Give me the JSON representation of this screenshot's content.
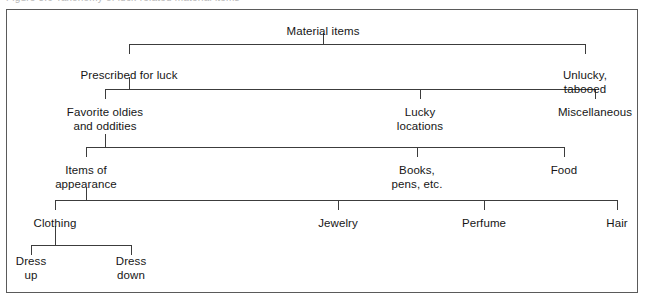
{
  "figure": {
    "caption_cut_off": "Figure 8.6   Taxonomy of luck-related material items",
    "frame_color": "#5a5a5a",
    "line_color": "#3c3c3c",
    "text_color": "#161616",
    "background": "#ffffff"
  },
  "chart_data": {
    "type": "tree",
    "title": "Material items",
    "orientation": "top-down",
    "levels": 6,
    "nodes": [
      {
        "id": "material-items",
        "label": "Material items",
        "level": 1,
        "x": 323,
        "y": 25,
        "parent": null
      },
      {
        "id": "prescribed-for-luck",
        "label": "Prescribed for luck",
        "level": 2,
        "x": 129,
        "y": 69,
        "parent": "material-items"
      },
      {
        "id": "unlucky-tabooed",
        "label": "Unlucky, tabooed",
        "level": 2,
        "x": 585,
        "y": 69,
        "parent": "material-items"
      },
      {
        "id": "favorite-oldies",
        "label": "Favorite oldies\nand oddities",
        "level": 3,
        "x": 105,
        "y": 106,
        "parent": "prescribed-for-luck"
      },
      {
        "id": "lucky-locations",
        "label": "Lucky\nlocations",
        "level": 3,
        "x": 420,
        "y": 106,
        "parent": "prescribed-for-luck"
      },
      {
        "id": "miscellaneous",
        "label": "Miscellaneous",
        "level": 3,
        "x": 595,
        "y": 106,
        "parent": "prescribed-for-luck"
      },
      {
        "id": "items-of-appearance",
        "label": "Items of\nappearance",
        "level": 4,
        "x": 86,
        "y": 164,
        "parent": "favorite-oldies"
      },
      {
        "id": "books-pens-etc",
        "label": "Books,\npens, etc.",
        "level": 4,
        "x": 417,
        "y": 164,
        "parent": "favorite-oldies"
      },
      {
        "id": "food",
        "label": "Food",
        "level": 4,
        "x": 564,
        "y": 164,
        "parent": "favorite-oldies"
      },
      {
        "id": "clothing",
        "label": "Clothing",
        "level": 5,
        "x": 55,
        "y": 217,
        "parent": "items-of-appearance"
      },
      {
        "id": "jewelry",
        "label": "Jewelry",
        "level": 5,
        "x": 338,
        "y": 217,
        "parent": "items-of-appearance"
      },
      {
        "id": "perfume",
        "label": "Perfume",
        "level": 5,
        "x": 484,
        "y": 217,
        "parent": "items-of-appearance"
      },
      {
        "id": "hair",
        "label": "Hair",
        "level": 5,
        "x": 617,
        "y": 217,
        "parent": "items-of-appearance"
      },
      {
        "id": "dress-up",
        "label": "Dress\nup",
        "level": 6,
        "x": 31,
        "y": 255,
        "parent": "clothing"
      },
      {
        "id": "dress-down",
        "label": "Dress\ndown",
        "level": 6,
        "x": 131,
        "y": 255,
        "parent": "clothing"
      }
    ],
    "connectors": [
      {
        "id": "connector-level-1",
        "from": "material-items",
        "stem_x": 323,
        "stem_top": 33,
        "bar_y": 44,
        "bar_x1": 129,
        "bar_x2": 585,
        "children": [
          129,
          585
        ]
      },
      {
        "id": "connector-level-2",
        "from": "prescribed-for-luck",
        "stem_x": 129,
        "stem_top": 77,
        "bar_y": 89,
        "bar_x1": 105,
        "bar_x2": 595,
        "children": [
          105,
          420,
          595
        ]
      },
      {
        "id": "connector-level-3",
        "from": "favorite-oldies",
        "stem_x": 105,
        "stem_top": 134,
        "bar_y": 147,
        "bar_x1": 86,
        "bar_x2": 564,
        "children": [
          86,
          417,
          564
        ]
      },
      {
        "id": "connector-level-4",
        "from": "items-of-appearance",
        "stem_x": 86,
        "stem_top": 188,
        "bar_y": 200,
        "bar_x1": 55,
        "bar_x2": 617,
        "children": [
          55,
          338,
          484,
          617
        ]
      },
      {
        "id": "connector-level-5",
        "from": "clothing",
        "stem_x": 55,
        "stem_top": 226,
        "bar_y": 245,
        "bar_x1": 31,
        "bar_x2": 131,
        "children": [
          31,
          131
        ]
      }
    ]
  }
}
